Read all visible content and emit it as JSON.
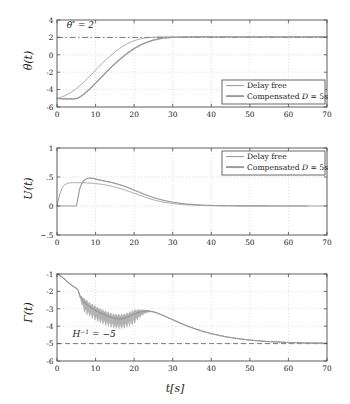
{
  "figure": {
    "width": 350,
    "height": 404,
    "background": "#ffffff",
    "curve_color_delay_free": "#8c8c8c",
    "curve_color_compensated": "#9a9a9a",
    "axis_color": "#4d4d4d",
    "grid_color": "#c8c8c8",
    "dash_color": "#6e6e6e",
    "xlabel": "t[s]"
  },
  "legend": {
    "entries": [
      {
        "label": "Delay free",
        "color": "#8c8c8c",
        "width": 0.9
      },
      {
        "label": "Compensated D = 5s",
        "color": "#9a9a9a",
        "width": 1.9
      }
    ]
  },
  "chart_data": [
    {
      "type": "line",
      "panel": "theta",
      "title": "",
      "xlabel": "t[s]",
      "ylabel": "θ(t)",
      "xlim": [
        0,
        70
      ],
      "ylim": [
        -6,
        4
      ],
      "xticks": [
        0,
        10,
        20,
        30,
        40,
        50,
        60,
        70
      ],
      "yticks": [
        -6,
        -4,
        -2,
        0,
        2,
        4
      ],
      "grid": true,
      "annotation": {
        "text": "θ* = 2",
        "x": 2.5,
        "y": 3.1
      },
      "reference_line": {
        "value": 2,
        "style": "dashdot",
        "label": "θ* = 2"
      },
      "legend_position": "lower-right",
      "series": [
        {
          "name": "Delay free",
          "x": [
            0,
            1,
            2,
            3,
            4,
            5,
            6,
            7,
            8,
            9,
            10,
            11,
            12,
            13,
            14,
            15,
            16,
            17,
            18,
            19,
            20,
            21,
            22,
            23,
            24,
            25,
            26,
            27,
            28,
            30,
            32,
            34,
            36,
            38,
            40,
            45,
            50,
            55,
            60,
            65,
            70
          ],
          "y": [
            -5.0,
            -4.88,
            -4.72,
            -4.5,
            -4.22,
            -3.9,
            -3.52,
            -3.12,
            -2.68,
            -2.22,
            -1.76,
            -1.3,
            -0.86,
            -0.44,
            -0.05,
            0.32,
            0.65,
            0.95,
            1.22,
            1.44,
            1.62,
            1.76,
            1.87,
            1.94,
            1.99,
            2.02,
            2.04,
            2.05,
            2.06,
            2.06,
            2.06,
            2.06,
            2.06,
            2.06,
            2.06,
            2.06,
            2.06,
            2.06,
            2.06,
            2.06,
            2.06
          ]
        },
        {
          "name": "Compensated D = 5s",
          "x": [
            0,
            1,
            2,
            3,
            4,
            5,
            5.5,
            6,
            7,
            8,
            9,
            10,
            11,
            12,
            13,
            14,
            15,
            16,
            17,
            18,
            19,
            20,
            21,
            22,
            23,
            24,
            25,
            26,
            27,
            28,
            30,
            32,
            34,
            36,
            38,
            40,
            45,
            50,
            55,
            60,
            65,
            70
          ],
          "y": [
            -5.05,
            -5.05,
            -5.05,
            -5.05,
            -5.05,
            -5.02,
            -4.95,
            -4.82,
            -4.5,
            -4.12,
            -3.7,
            -3.25,
            -2.8,
            -2.34,
            -1.88,
            -1.44,
            -1.02,
            -0.62,
            -0.25,
            0.1,
            0.42,
            0.72,
            0.98,
            1.2,
            1.4,
            1.56,
            1.7,
            1.8,
            1.88,
            1.94,
            2.0,
            2.03,
            2.05,
            2.06,
            2.06,
            2.06,
            2.06,
            2.06,
            2.06,
            2.06,
            2.06,
            2.06
          ],
          "noise": {
            "amplitude": 0.13,
            "start": 0,
            "end": 40,
            "decay_from": 25
          }
        }
      ]
    },
    {
      "type": "line",
      "panel": "U",
      "title": "",
      "xlabel": "t[s]",
      "ylabel": "U(t)",
      "xlim": [
        0,
        70
      ],
      "ylim": [
        -0.5,
        1
      ],
      "xticks": [
        0,
        10,
        20,
        30,
        40,
        50,
        60,
        70
      ],
      "yticks": [
        -0.5,
        0,
        0.5,
        1
      ],
      "grid": true,
      "legend_position": "upper-right",
      "series": [
        {
          "name": "Delay free",
          "x": [
            0,
            0.4,
            0.8,
            1.2,
            1.6,
            2,
            2.5,
            3,
            3.5,
            4,
            5,
            6,
            7,
            8,
            9,
            10,
            11,
            12,
            13,
            14,
            15,
            16,
            17,
            18,
            19,
            20,
            21,
            22,
            23,
            24,
            25,
            26,
            28,
            30,
            32,
            34,
            36,
            38,
            40,
            45,
            50,
            55,
            60,
            65,
            70
          ],
          "y": [
            0,
            0.12,
            0.22,
            0.29,
            0.34,
            0.365,
            0.385,
            0.395,
            0.4,
            0.402,
            0.403,
            0.402,
            0.4,
            0.397,
            0.393,
            0.387,
            0.379,
            0.369,
            0.357,
            0.343,
            0.327,
            0.309,
            0.289,
            0.267,
            0.244,
            0.22,
            0.196,
            0.172,
            0.149,
            0.128,
            0.108,
            0.09,
            0.062,
            0.042,
            0.028,
            0.019,
            0.013,
            0.009,
            0.006,
            0.003,
            0.002,
            0.001,
            0.001,
            0.0,
            0.0
          ]
        },
        {
          "name": "Compensated D = 5s",
          "x": [
            0,
            1,
            2,
            3,
            4,
            5,
            5.2,
            5.6,
            6,
            6.5,
            7,
            7.5,
            8,
            8.5,
            9,
            9.5,
            10,
            11,
            12,
            13,
            14,
            15,
            16,
            17,
            18,
            19,
            20,
            21,
            22,
            23,
            24,
            25,
            26,
            28,
            30,
            32,
            34,
            36,
            38,
            40,
            45,
            50,
            55,
            60,
            65,
            70
          ],
          "y": [
            0,
            0,
            0,
            0,
            0,
            0,
            0.06,
            0.2,
            0.32,
            0.4,
            0.44,
            0.465,
            0.478,
            0.482,
            0.48,
            0.474,
            0.466,
            0.45,
            0.436,
            0.422,
            0.408,
            0.392,
            0.373,
            0.352,
            0.328,
            0.302,
            0.275,
            0.247,
            0.22,
            0.194,
            0.17,
            0.147,
            0.126,
            0.092,
            0.066,
            0.046,
            0.032,
            0.022,
            0.015,
            0.01,
            0.004,
            0.002,
            0.001,
            0.0,
            0.0
          ],
          "noise": {
            "amplitude": 0.012,
            "start": 8,
            "end": 26,
            "decay_from": 14
          }
        }
      ]
    },
    {
      "type": "line",
      "panel": "Gamma",
      "title": "",
      "xlabel": "t[s]",
      "ylabel": "Γ(t)",
      "xlim": [
        0,
        70
      ],
      "ylim": [
        -6,
        -1
      ],
      "xticks": [
        0,
        10,
        20,
        30,
        40,
        50,
        60,
        70
      ],
      "yticks": [
        -6,
        -5,
        -4,
        -3,
        -2,
        -1
      ],
      "grid": true,
      "annotation": {
        "text": "H⁻¹ = −5",
        "x": 4,
        "y": -4.62
      },
      "reference_line": {
        "value": -5,
        "style": "dashed",
        "label": "H^{-1} = -5"
      },
      "series": [
        {
          "name": "Delay free",
          "x": [
            0,
            1,
            2,
            3,
            4,
            5,
            5.5,
            6,
            7,
            8,
            9,
            10,
            11,
            12,
            13,
            14,
            15,
            16,
            17,
            18,
            19,
            20,
            21,
            22,
            23,
            24,
            25,
            26,
            28,
            30,
            32,
            34,
            36,
            38,
            40,
            42,
            44,
            46,
            48,
            50,
            52,
            55,
            58,
            60,
            63,
            66,
            70
          ],
          "y": [
            -1.0,
            -1.12,
            -1.3,
            -1.5,
            -1.68,
            -1.82,
            -1.95,
            -2.28,
            -2.6,
            -2.8,
            -2.95,
            -3.08,
            -3.2,
            -3.3,
            -3.4,
            -3.48,
            -3.54,
            -3.57,
            -3.56,
            -3.5,
            -3.4,
            -3.3,
            -3.21,
            -3.15,
            -3.12,
            -3.13,
            -3.17,
            -3.24,
            -3.42,
            -3.62,
            -3.82,
            -4.0,
            -4.16,
            -4.3,
            -4.42,
            -4.52,
            -4.61,
            -4.68,
            -4.74,
            -4.79,
            -4.83,
            -4.88,
            -4.91,
            -4.93,
            -4.95,
            -4.96,
            -4.97
          ]
        },
        {
          "name": "Compensated D = 5s",
          "x": [
            0,
            1,
            2,
            3,
            4,
            5,
            5.5,
            6,
            7,
            8,
            9,
            10,
            11,
            12,
            13,
            14,
            15,
            16,
            17,
            18,
            19,
            20,
            21,
            22,
            23,
            24,
            25,
            26,
            28,
            30,
            32,
            34,
            36,
            38,
            40,
            42,
            44,
            46,
            48,
            50,
            52,
            55,
            58,
            60,
            63,
            66,
            70
          ],
          "y": [
            -1.0,
            -1.12,
            -1.3,
            -1.5,
            -1.68,
            -1.82,
            -1.95,
            -2.3,
            -2.62,
            -2.82,
            -2.97,
            -3.1,
            -3.22,
            -3.32,
            -3.42,
            -3.5,
            -3.56,
            -3.58,
            -3.57,
            -3.51,
            -3.41,
            -3.31,
            -3.22,
            -3.16,
            -3.13,
            -3.14,
            -3.18,
            -3.25,
            -3.43,
            -3.63,
            -3.83,
            -4.01,
            -4.17,
            -4.31,
            -4.43,
            -4.53,
            -4.62,
            -4.69,
            -4.75,
            -4.8,
            -4.84,
            -4.89,
            -4.92,
            -4.94,
            -4.96,
            -4.97,
            -4.98
          ],
          "noise": {
            "amplitude": 0.62,
            "start": 5.5,
            "end": 26,
            "decay_from": 20
          }
        }
      ]
    }
  ]
}
